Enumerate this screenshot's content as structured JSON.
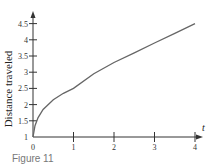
{
  "chart_data": {
    "type": "line",
    "title": "",
    "xlabel": "t",
    "ylabel": "Distance traveled",
    "xlim": [
      0,
      4
    ],
    "ylim": [
      1,
      4.5
    ],
    "x_ticks": [
      "0",
      "1",
      "2",
      "3",
      "4"
    ],
    "y_ticks": [
      "1",
      "1.5",
      "2",
      "2.5",
      "3",
      "3.5",
      "4",
      "4.5"
    ],
    "grid": false,
    "legend": null,
    "series": [
      {
        "name": "Distance traveled",
        "x": [
          0,
          0.05,
          0.125,
          0.25,
          0.5,
          0.75,
          1,
          1.5,
          2,
          2.5,
          3,
          3.5,
          4
        ],
        "values": [
          1,
          1.35,
          1.6,
          1.85,
          2.15,
          2.35,
          2.5,
          2.95,
          3.3,
          3.6,
          3.9,
          4.2,
          4.5
        ]
      }
    ]
  },
  "caption": "Figure 11"
}
